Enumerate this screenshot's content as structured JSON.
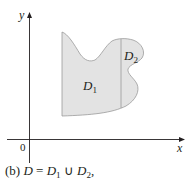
{
  "figure": {
    "axes": {
      "x_label": "x",
      "y_label": "y",
      "origin_label": "0"
    },
    "regions": [
      {
        "label": "D",
        "subscript": "1"
      },
      {
        "label": "D",
        "subscript": "2"
      }
    ],
    "caption": {
      "prefix": "(b)",
      "text_main": "D",
      "equals": "=",
      "d1": "D",
      "d1_sub": "1",
      "union": "∪",
      "d2": "D",
      "d2_sub": "2",
      "suffix": ","
    },
    "colors": {
      "region_fill": "#e3e3e3",
      "region_stroke": "#9a9a9a",
      "axis": "#231f20",
      "divider": "#9a9a9a"
    }
  }
}
